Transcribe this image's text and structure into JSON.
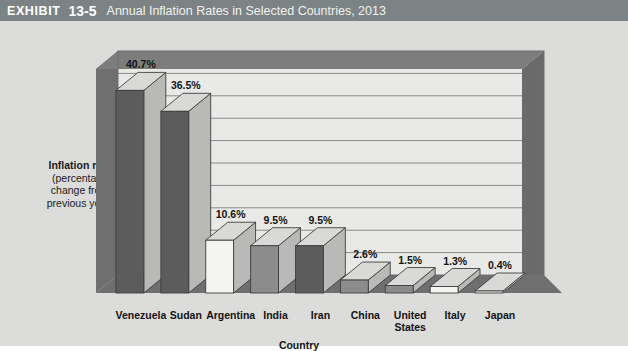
{
  "header": {
    "exhibit_label": "EXHIBIT",
    "exhibit_number": "13-5",
    "title": "Annual Inflation Rates in Selected Countries, 2013",
    "bar_color": "#7b8385"
  },
  "axis": {
    "y_title_bold": "Inflation rate",
    "y_title_line1": "(percentage",
    "y_title_line2": "change from",
    "y_title_line3": "previous year)",
    "x_title": "Country"
  },
  "colors": {
    "page_background": "#dcdcda",
    "plot_background": "#e9e9e7",
    "frame": "#6f6f6f",
    "floor": "#6f6f6f",
    "gridline": "#8a8a8a",
    "bar_front_dark": "#5c5c5c",
    "bar_front_mid": "#8c8c8c",
    "bar_front_light": "#f4f4f2",
    "bar_side": "#b9b9b7",
    "bar_top": "#d9d9d7"
  },
  "chart_data": {
    "type": "bar",
    "title": "Annual Inflation Rates in Selected Countries, 2013",
    "xlabel": "Country",
    "ylabel": "Inflation rate (percentage change from previous year)",
    "ylim": [
      0,
      45
    ],
    "grid": true,
    "legend": "none",
    "categories": [
      "Venezuela",
      "Sudan",
      "Argentina",
      "India",
      "Iran",
      "China",
      "United States",
      "Italy",
      "Japan"
    ],
    "values": [
      40.7,
      36.5,
      10.6,
      9.5,
      9.5,
      2.6,
      1.5,
      1.3,
      0.4
    ],
    "data_labels": [
      "40.7%",
      "36.5%",
      "10.6%",
      "9.5%",
      "9.5%",
      "2.6%",
      "1.5%",
      "1.3%",
      "0.4%"
    ],
    "bar_shades": [
      "dark",
      "dark",
      "light",
      "mid",
      "dark",
      "mid",
      "mid",
      "light",
      "light"
    ]
  },
  "category_label_lines": [
    "Venezuela",
    "Sudan",
    "Argentina",
    "India",
    "Iran",
    "China",
    "United\nStates",
    "Italy",
    "Japan"
  ]
}
